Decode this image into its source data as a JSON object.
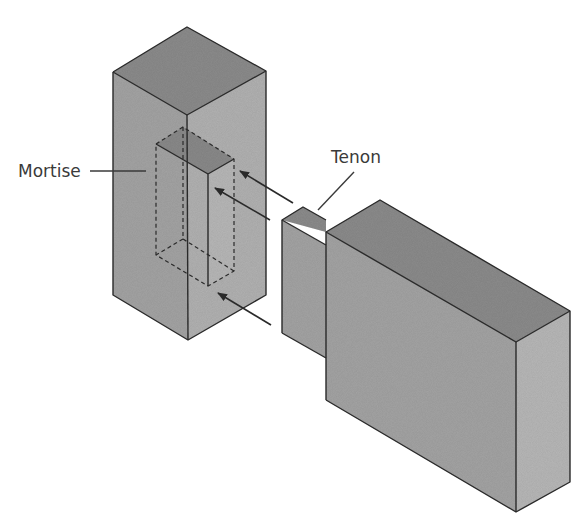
{
  "diagram": {
    "type": "isometric-joinery",
    "labels": {
      "mortise": "Mortise",
      "tenon": "Tenon"
    },
    "colors": {
      "top_face": "#8c8c8c",
      "left_face": "#a4a4a4",
      "right_face": "#b8b8b8",
      "hole_top": "#8a8a8a",
      "hole_inner": "#b0b0b0",
      "edge": "#2a2a2a",
      "background": "#ffffff"
    },
    "arrows_count": 3
  }
}
